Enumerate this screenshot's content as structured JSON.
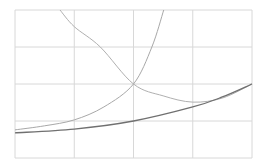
{
  "chart_data": {
    "type": "line",
    "title": "",
    "xlabel": "",
    "ylabel": "",
    "xlim": [
      0,
      4
    ],
    "ylim": [
      0,
      4
    ],
    "grid": true,
    "x_gridlines": [
      0,
      1,
      2,
      3,
      4
    ],
    "y_gridlines": [
      0,
      1,
      2,
      3,
      4
    ],
    "legend": null,
    "series": [
      {
        "name": "decreasing-convex",
        "color": "#b0b0b0",
        "x": [
          0.76,
          1.0,
          1.44,
          2.0,
          2.5,
          3.0,
          3.5,
          4.0
        ],
        "y": [
          4.0,
          3.55,
          3.0,
          2.0,
          1.68,
          1.51,
          1.62,
          2.0
        ]
      },
      {
        "name": "steep-increasing",
        "color": "#a8a8a8",
        "x": [
          0.0,
          0.5,
          1.0,
          1.5,
          2.0,
          2.31,
          2.51
        ],
        "y": [
          0.76,
          0.87,
          1.03,
          1.38,
          2.0,
          3.0,
          4.0
        ]
      },
      {
        "name": "gentle-increasing",
        "color": "#707070",
        "x": [
          0.0,
          1.0,
          2.0,
          3.0,
          3.5,
          4.0
        ],
        "y": [
          0.68,
          0.78,
          1.0,
          1.38,
          1.65,
          2.0
        ]
      }
    ]
  },
  "plot": {
    "left": 15,
    "top": 10,
    "right": 252,
    "bottom": 158
  }
}
